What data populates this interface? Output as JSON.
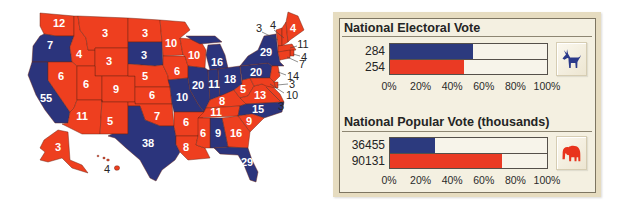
{
  "map": {
    "colors": {
      "dem": "#2b347c",
      "rep": "#ee3f1f"
    },
    "states": {
      "WA": {
        "ev": "12",
        "party": "rep"
      },
      "OR": {
        "ev": "7",
        "party": "dem"
      },
      "CA": {
        "ev": "55",
        "party": "dem"
      },
      "ID": {
        "ev": "4",
        "party": "rep"
      },
      "NV": {
        "ev": "6",
        "party": "rep"
      },
      "MT": {
        "ev": "3",
        "party": "rep"
      },
      "WY": {
        "ev": "3",
        "party": "rep"
      },
      "UT": {
        "ev": "6",
        "party": "rep"
      },
      "AZ": {
        "ev": "11",
        "party": "rep"
      },
      "CO": {
        "ev": "9",
        "party": "rep"
      },
      "NM": {
        "ev": "5",
        "party": "rep"
      },
      "ND": {
        "ev": "3",
        "party": "rep"
      },
      "SD": {
        "ev": "3",
        "party": "dem"
      },
      "NE": {
        "ev": "5",
        "party": "rep"
      },
      "KS": {
        "ev": "6",
        "party": "rep"
      },
      "OK": {
        "ev": "7",
        "party": "rep"
      },
      "TX": {
        "ev": "38",
        "party": "dem"
      },
      "MN": {
        "ev": "10",
        "party": "rep"
      },
      "IA": {
        "ev": "6",
        "party": "rep"
      },
      "MO": {
        "ev": "10",
        "party": "dem"
      },
      "AR": {
        "ev": "6",
        "party": "rep"
      },
      "LA": {
        "ev": "8",
        "party": "rep"
      },
      "WI": {
        "ev": "10",
        "party": "rep"
      },
      "IL": {
        "ev": "20",
        "party": "dem"
      },
      "MI": {
        "ev": "16",
        "party": "dem"
      },
      "IN": {
        "ev": "11",
        "party": "dem"
      },
      "OH": {
        "ev": "18",
        "party": "dem"
      },
      "KY": {
        "ev": "8",
        "party": "rep"
      },
      "TN": {
        "ev": "11",
        "party": "rep"
      },
      "MS": {
        "ev": "6",
        "party": "rep"
      },
      "AL": {
        "ev": "9",
        "party": "dem"
      },
      "GA": {
        "ev": "16",
        "party": "rep"
      },
      "FL": {
        "ev": "29",
        "party": "dem"
      },
      "SC": {
        "ev": "9",
        "party": "rep"
      },
      "NC": {
        "ev": "15",
        "party": "dem"
      },
      "VA": {
        "ev": "13",
        "party": "rep"
      },
      "WV": {
        "ev": "5",
        "party": "rep"
      },
      "PA": {
        "ev": "20",
        "party": "dem"
      },
      "NY": {
        "ev": "29",
        "party": "dem"
      },
      "VT": {
        "ev": "3",
        "party": "rep"
      },
      "NH": {
        "ev": "4",
        "party": "rep"
      },
      "ME": {
        "ev": "4",
        "party": "rep"
      },
      "MA": {
        "ev": "11",
        "party": "rep"
      },
      "RI": {
        "ev": "4",
        "party": "rep"
      },
      "CT": {
        "ev": "7",
        "party": "rep"
      },
      "NJ": {
        "ev": "14",
        "party": "rep"
      },
      "DE": {
        "ev": "3",
        "party": "rep"
      },
      "MD": {
        "ev": "10",
        "party": "rep"
      },
      "DC": {
        "ev": "3",
        "party": "rep"
      },
      "AK": {
        "ev": "3",
        "party": "rep"
      },
      "HI": {
        "ev": "4",
        "party": "rep"
      }
    }
  },
  "electoral": {
    "title": "National Electoral Vote",
    "rows": [
      {
        "label": "284",
        "party": "dem",
        "pct": 52.8
      },
      {
        "label": "254",
        "party": "rep",
        "pct": 47.2
      }
    ],
    "axis": [
      "0%",
      "20%",
      "40%",
      "60%",
      "80%",
      "100%"
    ],
    "icon": "donkey-icon"
  },
  "popular": {
    "title": "National Popular Vote (thousands)",
    "rows": [
      {
        "label": "36455",
        "party": "dem",
        "pct": 28.8
      },
      {
        "label": "90131",
        "party": "rep",
        "pct": 71.2
      }
    ],
    "axis": [
      "0%",
      "20%",
      "40%",
      "60%",
      "80%",
      "100%"
    ],
    "icon": "elephant-icon"
  },
  "chart_data": [
    {
      "type": "bar",
      "orientation": "horizontal",
      "title": "National Electoral Vote",
      "categories": [
        "Democratic",
        "Republican"
      ],
      "values": [
        284,
        254
      ],
      "percent_of_total": [
        52.8,
        47.2
      ],
      "colors": [
        "#2c3a7e",
        "#ea3a24"
      ],
      "xlabel": "",
      "ylabel": "",
      "xticks": [
        "0%",
        "20%",
        "40%",
        "60%",
        "80%",
        "100%"
      ],
      "xlim": [
        0,
        100
      ],
      "grid": false
    },
    {
      "type": "bar",
      "orientation": "horizontal",
      "title": "National Popular Vote (thousands)",
      "categories": [
        "Democratic",
        "Republican"
      ],
      "values": [
        36455,
        90131
      ],
      "percent_of_total": [
        28.8,
        71.2
      ],
      "colors": [
        "#2c3a7e",
        "#ea3a24"
      ],
      "xlabel": "",
      "ylabel": "",
      "xticks": [
        "0%",
        "20%",
        "40%",
        "60%",
        "80%",
        "100%"
      ],
      "xlim": [
        0,
        100
      ],
      "grid": false
    }
  ]
}
